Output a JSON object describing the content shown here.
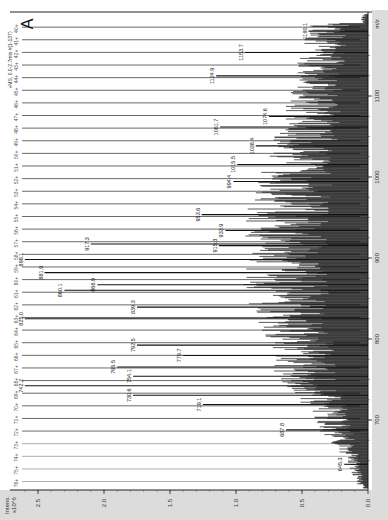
{
  "panel": {
    "letter": "A",
    "trace_title": "+MS, 0.0-2.7min #(1-137)"
  },
  "chart_data": {
    "type": "line",
    "title": "+MS, 0.0-2.7min #(1-137)",
    "panel_label": "A",
    "orientation": "rotated 90 degrees: m/z axis vertical (right), intensity axis horizontal (bottom, increasing leftwards)",
    "xlabel": "m/z",
    "ylabel": "Intens. x10^6",
    "xlim": [
      615,
      1200
    ],
    "ylim": [
      0.0,
      2.7
    ],
    "mz_ticks": [
      700,
      800,
      900,
      1000,
      1100
    ],
    "intensity_ticks": [
      "0.0",
      "0.5",
      "1.0",
      "1.5",
      "2.0",
      "2.5"
    ],
    "grid": false,
    "charge_state_series": {
      "name": "charge-state ladder",
      "labels": [
        "40+",
        "41+",
        "42+",
        "43+",
        "44+",
        "45+",
        "46+",
        "47+",
        "48+",
        "49+",
        "50+",
        "51+",
        "52+",
        "53+",
        "54+",
        "55+",
        "56+",
        "57+",
        "58+",
        "59+",
        "60+",
        "61+",
        "62+",
        "63+",
        "64+",
        "65+",
        "66+",
        "67+",
        "68+",
        "69+",
        "70+",
        "71+",
        "72+",
        "73+",
        "74+",
        "75+",
        "76+"
      ],
      "note": "Each charge state drawn as a long horizontal reference line reaching toward ~2.7 intensity; the ladder spans m/z ~1180 (40+) down to ~625 (76+)"
    },
    "labeled_peaks": [
      {
        "mz": 1180.1,
        "intensity": 0.45
      },
      {
        "mz": 1153.7,
        "intensity": 0.93
      },
      {
        "mz": 1124.9,
        "intensity": 1.15
      },
      {
        "mz": 1074.6,
        "intensity": 0.75
      },
      {
        "mz": 1061.7,
        "intensity": 1.12
      },
      {
        "mz": 1038.4,
        "intensity": 0.85
      },
      {
        "mz": 1015.5,
        "intensity": 0.99
      },
      {
        "mz": 994.4,
        "intensity": 1.02
      },
      {
        "mz": 953.6,
        "intensity": 1.26
      },
      {
        "mz": 933.9,
        "intensity": 1.08
      },
      {
        "mz": 915.3,
        "intensity": 1.13
      },
      {
        "mz": 917.3,
        "intensity": 2.1
      },
      {
        "mz": 898.1,
        "intensity": 2.6
      },
      {
        "mz": 881.9,
        "intensity": 2.45
      },
      {
        "mz": 866.9,
        "intensity": 2.05
      },
      {
        "mz": 860.1,
        "intensity": 2.3
      },
      {
        "mz": 839.3,
        "intensity": 1.75
      },
      {
        "mz": 825.0,
        "intensity": 2.6
      },
      {
        "mz": 792.5,
        "intensity": 1.75
      },
      {
        "mz": 779.7,
        "intensity": 1.4
      },
      {
        "mz": 765.5,
        "intensity": 1.9
      },
      {
        "mz": 754.1,
        "intensity": 1.78
      },
      {
        "mz": 742.2,
        "intensity": 2.6
      },
      {
        "mz": 730.6,
        "intensity": 1.78
      },
      {
        "mz": 719.1,
        "intensity": 1.25
      },
      {
        "mz": 687.8,
        "intensity": 0.62
      },
      {
        "mz": 645.3,
        "intensity": 0.18
      }
    ],
    "envelope": {
      "description": "Dense noisy baseline envelope of unresolved peaks; max envelope intensity roughly 0.9 near m/z 850-950, tapering to ~0.1 at m/z 640 and ~0.4 at m/z 1190",
      "mz": [
        620,
        650,
        680,
        700,
        730,
        760,
        800,
        850,
        900,
        950,
        1000,
        1050,
        1100,
        1150,
        1190
      ],
      "intensity": [
        0.08,
        0.15,
        0.3,
        0.4,
        0.52,
        0.65,
        0.72,
        0.85,
        0.88,
        0.85,
        0.75,
        0.65,
        0.55,
        0.48,
        0.4
      ]
    }
  },
  "axes": {
    "x_unit_label": "m/z",
    "y_title_line1": "Intens.",
    "y_title_line2": "x10^6",
    "mz_tick_labels": [
      "700",
      "800",
      "900",
      "1000",
      "1100"
    ],
    "intensity_tick_labels": [
      "0.0",
      "0.5",
      "1.0",
      "1.5",
      "2.0",
      "2.5"
    ]
  },
  "peak_labels": [
    "1180.1",
    "1153.7",
    "1124.9",
    "1074.6",
    "1061.7",
    "1038.4",
    "1015.5",
    "994.4",
    "953.6",
    "933.9",
    "915.3",
    "917.3",
    "898.1",
    "881.9",
    "866.9",
    "860.1",
    "839.3",
    "825.0",
    "792.5",
    "779.7",
    "765.5",
    "754.1",
    "742.2",
    "730.6",
    "719.1",
    "687.8",
    "645.3"
  ],
  "charge_labels": [
    "40+",
    "41+",
    "42+",
    "43+",
    "44+",
    "45+",
    "46+",
    "47+",
    "48+",
    "49+",
    "50+",
    "51+",
    "52+",
    "53+",
    "54+",
    "55+",
    "56+",
    "57+",
    "58+",
    "59+",
    "60+",
    "61+",
    "62+",
    "63+",
    "64+",
    "65+",
    "66+",
    "67+",
    "68+",
    "69+",
    "70+",
    "71+",
    "72+",
    "73+",
    "74+",
    "75+",
    "76+"
  ]
}
